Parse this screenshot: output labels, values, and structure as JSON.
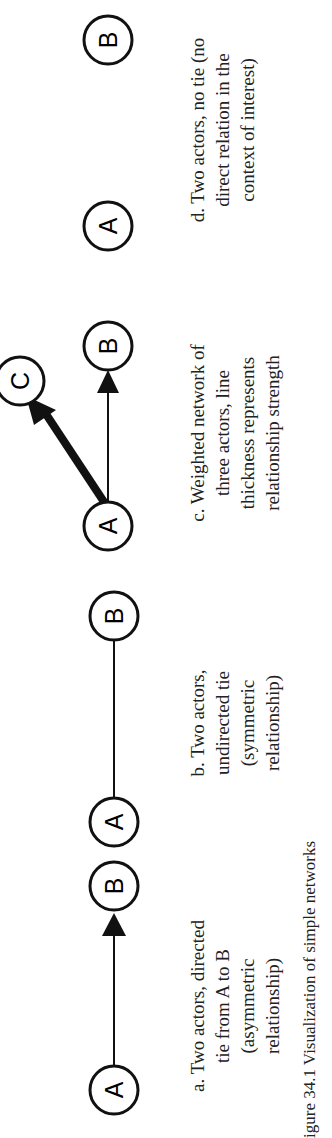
{
  "figure": {
    "caption": "igure 34.1  Visualization of simple networks"
  },
  "panels": [
    {
      "id": "a",
      "nodes": [
        "A",
        "B"
      ],
      "edge": "directed A→B",
      "caption_lines": [
        "a. Two actors, directed",
        "tie from A to B",
        "(asymmetric",
        "relationship)"
      ]
    },
    {
      "id": "b",
      "nodes": [
        "A",
        "B"
      ],
      "edge": "undirected A—B",
      "caption_lines": [
        "b. Two actors,",
        "undirected tie",
        "(symmetric",
        "relationship)"
      ]
    },
    {
      "id": "c",
      "nodes": [
        "A",
        "B",
        "C"
      ],
      "edge": "weighted: A→C thick, A→B thin",
      "caption_lines": [
        "c. Weighted network of",
        "three actors, line",
        "thickness represents",
        "relationship strength"
      ]
    },
    {
      "id": "d",
      "nodes": [
        "A",
        "B"
      ],
      "edge": "none",
      "caption_lines": [
        "d. Two actors, no tie (no",
        "direct relation in the",
        "context of interest)"
      ]
    }
  ]
}
